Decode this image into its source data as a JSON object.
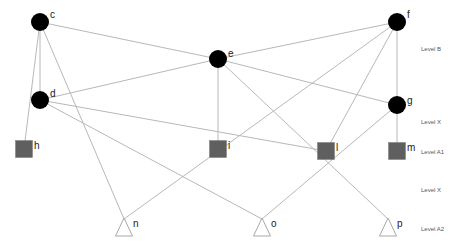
{
  "diagram": {
    "type": "layered-graph",
    "nodes": [
      {
        "id": "c",
        "label": "c",
        "shape": "circle",
        "x": 40,
        "y": 22,
        "lx": 50,
        "ly": 18
      },
      {
        "id": "d",
        "label": "d",
        "shape": "circle",
        "x": 40,
        "y": 100,
        "lx": 50,
        "ly": 97
      },
      {
        "id": "e",
        "label": "e",
        "shape": "circle",
        "x": 218,
        "y": 59,
        "lx": 228,
        "ly": 57
      },
      {
        "id": "f",
        "label": "f",
        "shape": "circle",
        "x": 397,
        "y": 22,
        "lx": 407,
        "ly": 18
      },
      {
        "id": "g",
        "label": "g",
        "shape": "circle",
        "x": 397,
        "y": 105,
        "lx": 407,
        "ly": 104
      },
      {
        "id": "h",
        "label": "h",
        "shape": "square",
        "x": 24,
        "y": 149,
        "lx": 34,
        "ly": 149
      },
      {
        "id": "i",
        "label": "i",
        "shape": "square",
        "x": 218,
        "y": 149,
        "lx": 228,
        "ly": 149
      },
      {
        "id": "l",
        "label": "l",
        "shape": "square",
        "x": 326,
        "y": 151,
        "lx": 336,
        "ly": 151
      },
      {
        "id": "m",
        "label": "m",
        "shape": "square",
        "x": 397,
        "y": 151,
        "lx": 407,
        "ly": 151
      },
      {
        "id": "n",
        "label": "n",
        "shape": "triangle",
        "x": 124,
        "y": 228,
        "lx": 133,
        "ly": 227
      },
      {
        "id": "o",
        "label": "o",
        "shape": "triangle",
        "x": 262,
        "y": 228,
        "lx": 271,
        "ly": 227
      },
      {
        "id": "p",
        "label": "p",
        "shape": "triangle",
        "x": 388,
        "y": 228,
        "lx": 397,
        "ly": 227
      }
    ],
    "edges": [
      [
        "c",
        "e"
      ],
      [
        "c",
        "d"
      ],
      [
        "c",
        "h"
      ],
      [
        "c",
        "n"
      ],
      [
        "d",
        "e"
      ],
      [
        "d",
        "l"
      ],
      [
        "d",
        "o"
      ],
      [
        "e",
        "f"
      ],
      [
        "e",
        "g"
      ],
      [
        "e",
        "i"
      ],
      [
        "e",
        "p"
      ],
      [
        "f",
        "g"
      ],
      [
        "f",
        "n"
      ],
      [
        "f",
        "l"
      ],
      [
        "g",
        "m"
      ],
      [
        "g",
        "o"
      ]
    ],
    "levels": [
      {
        "label": "Level B",
        "y": 49
      },
      {
        "label": "Level X",
        "y": 122
      },
      {
        "label": "Level A1",
        "y": 152
      },
      {
        "label": "Level X",
        "y": 190
      },
      {
        "label": "Level A2",
        "y": 229
      }
    ],
    "colors": {
      "circle": "#000000",
      "square": "#5f5f5f",
      "triangle_stroke": "#a8a8a8",
      "edge": "#b8b8b8"
    }
  }
}
